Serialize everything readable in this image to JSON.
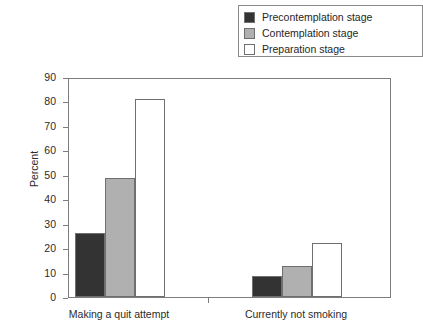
{
  "chart_data": {
    "type": "bar",
    "title": "",
    "xlabel": "",
    "ylabel": "Percent",
    "ylim": [
      0,
      90
    ],
    "ytick_step": 10,
    "yticks": [
      90,
      80,
      70,
      60,
      50,
      40,
      30,
      20,
      10,
      0
    ],
    "grid": false,
    "legend_position": "top-right",
    "categories": [
      "Making a quit attempt",
      "Currently not smoking"
    ],
    "series": [
      {
        "name": "Precontemplation stage",
        "color": "#333333",
        "values": [
          26,
          8.5
        ]
      },
      {
        "name": "Contemplation stage",
        "color": "#b0b0b0",
        "values": [
          48.5,
          12.5
        ]
      },
      {
        "name": "Preparation stage",
        "color": "#ffffff",
        "values": [
          81,
          22
        ]
      }
    ]
  },
  "legend": {
    "items": [
      {
        "label": "Precontemplation stage"
      },
      {
        "label": "Contemplation stage"
      },
      {
        "label": "Preparation stage"
      }
    ]
  },
  "axes": {
    "y_title": "Percent",
    "y_labels": [
      "90",
      "80",
      "70",
      "60",
      "50",
      "40",
      "30",
      "20",
      "10",
      "0"
    ],
    "x_labels": [
      "Making a quit attempt",
      "Currently not smoking"
    ]
  }
}
